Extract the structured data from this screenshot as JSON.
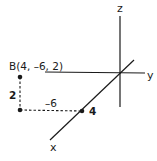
{
  "diagram": {
    "title": "",
    "axes": {
      "x_label": "x",
      "y_label": "y",
      "z_label": "z"
    },
    "point": {
      "label": "B(4, –6, 2)",
      "coordinates": [
        4,
        -6,
        2
      ]
    },
    "annotations": {
      "x_value": "4",
      "y_value": "–6",
      "z_value": "2"
    },
    "colors": {
      "ink": "#1a1a1a",
      "background": "#ffffff"
    }
  }
}
